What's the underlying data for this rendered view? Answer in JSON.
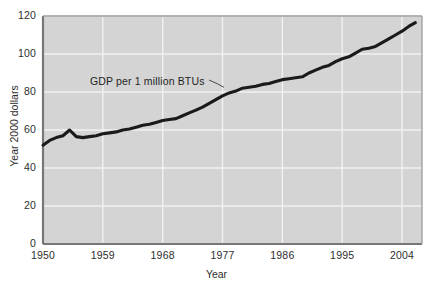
{
  "chart_data": {
    "type": "line",
    "title": "",
    "xlabel": "Year",
    "ylabel": "Year 2000 dollars",
    "xlim": [
      1950,
      2007
    ],
    "ylim": [
      0,
      120
    ],
    "grid": true,
    "legend": "none",
    "series_name": "GDP per 1 million BTUs",
    "annotation": "GDP per 1 million BTUs",
    "xticks": [
      "1950",
      "1959",
      "1968",
      "1977",
      "1986",
      "1995",
      "2004"
    ],
    "xtick_values": [
      1950,
      1959,
      1968,
      1977,
      1986,
      1995,
      2004
    ],
    "yticks": [
      "0",
      "20",
      "40",
      "60",
      "80",
      "100",
      "120"
    ],
    "ytick_values": [
      0,
      20,
      40,
      60,
      80,
      100,
      120
    ],
    "x": [
      1950,
      1951,
      1952,
      1953,
      1954,
      1955,
      1956,
      1957,
      1958,
      1959,
      1960,
      1961,
      1962,
      1963,
      1964,
      1965,
      1966,
      1967,
      1968,
      1969,
      1970,
      1971,
      1972,
      1973,
      1974,
      1975,
      1976,
      1977,
      1978,
      1979,
      1980,
      1981,
      1982,
      1983,
      1984,
      1985,
      1986,
      1987,
      1988,
      1989,
      1990,
      1991,
      1992,
      1993,
      1994,
      1995,
      1996,
      1997,
      1998,
      1999,
      2000,
      2001,
      2002,
      2003,
      2004,
      2005,
      2006
    ],
    "y": [
      52,
      54.5,
      56,
      57,
      60,
      56.5,
      56,
      56.5,
      57,
      58,
      58.5,
      59,
      60,
      60.5,
      61.5,
      62.5,
      63,
      64,
      65,
      65.5,
      66,
      67.5,
      69,
      70.5,
      72,
      74,
      76,
      78,
      79.5,
      80.5,
      82,
      82.5,
      83,
      84,
      84.5,
      85.5,
      86.5,
      87,
      87.5,
      88,
      90,
      91.5,
      93,
      94,
      96,
      97.5,
      98.5,
      100.5,
      102.5,
      103,
      104,
      106,
      108,
      110,
      112,
      114.5,
      116.5
    ],
    "series_color": "#1a1a1a",
    "plot_background": "#d4d4d4",
    "grid_color": "#f2f2f2",
    "axis_color": "#8a8a8a"
  }
}
